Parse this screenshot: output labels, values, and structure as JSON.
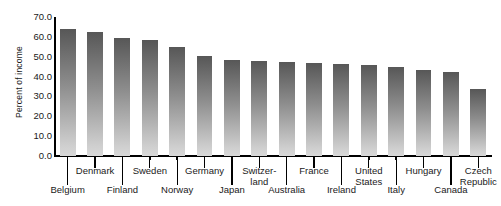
{
  "chart_data": {
    "type": "bar",
    "title": "",
    "subtitle": "",
    "xlabel": "",
    "ylabel": "Percent of income",
    "ylim": [
      0.0,
      70.0
    ],
    "ytick_step": 10.0,
    "ytick_labels": [
      "70.0",
      "60.0",
      "50.0",
      "40.0",
      "30.0",
      "20.0",
      "10.0",
      "0.0"
    ],
    "ytick_values": [
      70.0,
      60.0,
      50.0,
      40.0,
      30.0,
      20.0,
      10.0,
      0.0
    ],
    "grid": false,
    "legend": false,
    "legend_position": "none",
    "annotations": [],
    "categories": [
      "Belgium",
      "Denmark",
      "Finland",
      "Sweden",
      "Norway",
      "Germany",
      "Japan",
      "Switzer-\nland",
      "Australia",
      "France",
      "Ireland",
      "United\nStates",
      "Italy",
      "Hungary",
      "Canada",
      "Czech\nRepublic"
    ],
    "values": [
      64.0,
      62.5,
      59.5,
      58.5,
      55.0,
      50.5,
      48.5,
      48.0,
      47.5,
      47.0,
      46.5,
      46.0,
      45.0,
      43.5,
      42.5,
      34.0
    ],
    "bar_color_top": "#575757",
    "bar_color_bottom": "#d8d8d8"
  },
  "axis": {
    "y_title": "Percent of income"
  }
}
